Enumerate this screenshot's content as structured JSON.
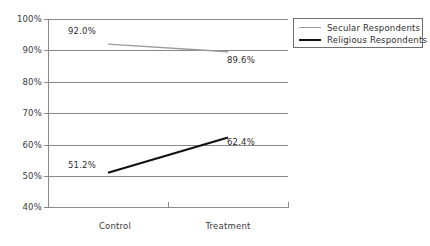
{
  "chart_data": {
    "type": "line",
    "title": "",
    "subtitle": "",
    "xlabel": "",
    "ylabel": "",
    "categories": [
      "Control",
      "Treatment"
    ],
    "ylim": [
      40,
      100
    ],
    "ytick_labels": [
      "100%",
      "90%",
      "80%",
      "70%",
      "60%",
      "50%",
      "40%"
    ],
    "ytick_values": [
      100,
      90,
      80,
      70,
      60,
      50,
      40
    ],
    "grid": true,
    "legend_position": "top-right",
    "series": [
      {
        "name": "Secular Respondents",
        "color": "#9a9a9a",
        "values": [
          92.0,
          89.6
        ],
        "labels": [
          "92.0%",
          "89.6%"
        ]
      },
      {
        "name": "Religious Respondents",
        "color": "#111111",
        "values": [
          51.2,
          62.4
        ],
        "labels": [
          "51.2%",
          "62.4%"
        ]
      }
    ],
    "point_labels": [
      {
        "text": "92.0%",
        "series": "Secular Respondents",
        "category": "Control"
      },
      {
        "text": "89.6%",
        "series": "Secular Respondents",
        "category": "Treatment"
      },
      {
        "text": "51.2%",
        "series": "Religious Respondents",
        "category": "Control"
      },
      {
        "text": "62.4%",
        "series": "Religious Respondents",
        "category": "Treatment"
      }
    ]
  },
  "axis": {
    "y_labels": {
      "t100": "100%",
      "t90": "90%",
      "t80": "80%",
      "t70": "70%",
      "t60": "60%",
      "t50": "50%",
      "t40": "40%"
    },
    "x_labels": {
      "c0": "Control",
      "c1": "Treatment"
    }
  },
  "legend": {
    "items": [
      {
        "label": "Secular Respondents"
      },
      {
        "label": "Religious Respondents"
      }
    ]
  },
  "labels": {
    "secular_control": "92.0%",
    "secular_treatment": "89.6%",
    "religious_control": "51.2%",
    "religious_treatment": "62.4%"
  },
  "colors": {
    "secular_line": "#9a9a9a",
    "religious_line": "#111111",
    "grid": "#888888",
    "axis": "#8a8a8a",
    "text": "#2e2e2e"
  }
}
